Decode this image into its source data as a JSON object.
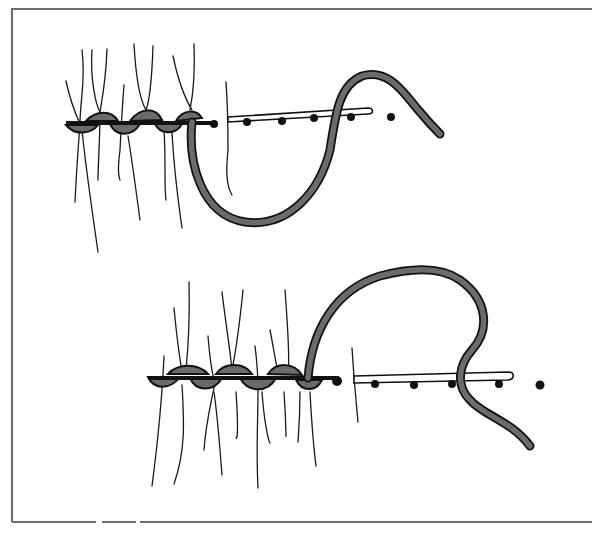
{
  "figure": {
    "type": "embroidery-stitch-diagram",
    "panels": [
      {
        "id": "top",
        "stitches_completed": 4,
        "needle_dots": 4
      },
      {
        "id": "bottom",
        "stitches_completed": 6,
        "needle_dots": 5
      }
    ],
    "colors": {
      "thread": "#6b6b6b",
      "outline": "#111111",
      "frame": "#6e6e6e",
      "background": "#ffffff"
    }
  }
}
